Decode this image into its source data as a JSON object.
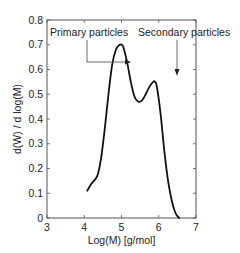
{
  "chart_data": {
    "type": "line",
    "title": "",
    "xlabel": "Log(M) [g/mol]",
    "ylabel": "d(W) / d log(M)",
    "xlim": [
      3,
      7
    ],
    "ylim": [
      0,
      0.8
    ],
    "xticks": [
      3,
      4,
      5,
      6,
      7
    ],
    "yticks": [
      0,
      0.1,
      0.2,
      0.3,
      0.4,
      0.5,
      0.6,
      0.7,
      0.8
    ],
    "ytick_labels": [
      "0",
      "0.1",
      "0.2",
      "0.3",
      "0.4",
      "0.5",
      "0.6",
      "0.7",
      "0.8"
    ],
    "grid": false,
    "legend": null,
    "series": [
      {
        "name": "MWD",
        "x": [
          4.08,
          4.2,
          4.35,
          4.45,
          4.55,
          4.65,
          4.75,
          4.85,
          4.95,
          5.0,
          5.05,
          5.15,
          5.25,
          5.35,
          5.45,
          5.55,
          5.65,
          5.75,
          5.85,
          5.9,
          5.95,
          6.05,
          6.15,
          6.25,
          6.35,
          6.45,
          6.55
        ],
        "y": [
          0.11,
          0.14,
          0.17,
          0.24,
          0.36,
          0.5,
          0.62,
          0.68,
          0.7,
          0.7,
          0.69,
          0.63,
          0.55,
          0.49,
          0.47,
          0.475,
          0.5,
          0.53,
          0.55,
          0.55,
          0.53,
          0.42,
          0.27,
          0.15,
          0.07,
          0.02,
          0.0
        ]
      }
    ],
    "annotations": [
      {
        "text": "Primary particles",
        "points_to": [
          4.98,
          0.62
        ]
      },
      {
        "text": "Secondary particles",
        "points_to": [
          5.9,
          0.56
        ]
      }
    ]
  }
}
